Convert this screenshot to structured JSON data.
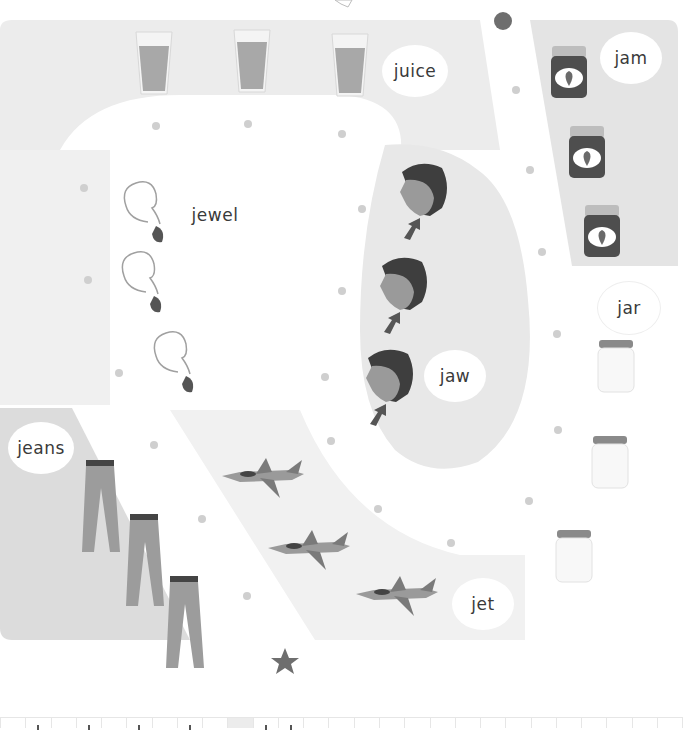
{
  "worksheet": {
    "theme": "Letter J words path maze",
    "start_marker": "circle",
    "end_marker": "star",
    "colors": {
      "background": "#ffffff",
      "region_light": "#ececec",
      "region_mid": "#e3e3e3",
      "region_dark": "#d6d6d6",
      "dot": "#cfcfcf",
      "marker": "#6e6e6e",
      "text": "#3a3a3a"
    }
  },
  "groups": [
    {
      "word": "juice",
      "item": "glass-of-juice",
      "count": 3
    },
    {
      "word": "jam",
      "item": "jam-jar",
      "count": 3
    },
    {
      "word": "jewel",
      "item": "jewel-pendant",
      "count": 3
    },
    {
      "word": "jaw",
      "item": "face-with-arrow-to-jaw",
      "count": 3
    },
    {
      "word": "jar",
      "item": "empty-glass-jar",
      "count": 3
    },
    {
      "word": "jeans",
      "item": "pair-of-jeans",
      "count": 3
    },
    {
      "word": "jet",
      "item": "fighter-jet",
      "count": 3
    }
  ],
  "labels": {
    "juice": "juice",
    "jam": "jam",
    "jewel": "jewel",
    "jaw": "jaw",
    "jar": "jar",
    "jeans": "jeans",
    "jet": "jet"
  },
  "writing_row": {
    "cells": 27,
    "shaded_cell_index": 9
  }
}
